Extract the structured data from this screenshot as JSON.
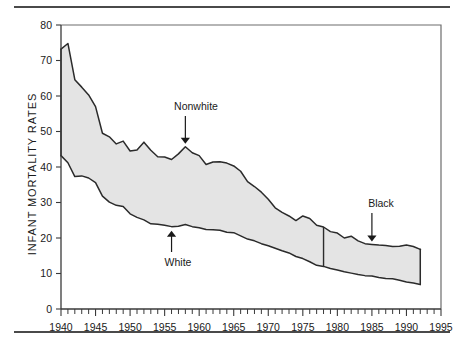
{
  "figure": {
    "top_rule": "",
    "bottom_rule": ""
  },
  "chart_data": {
    "type": "area",
    "title": "",
    "subtitle": "",
    "xlabel": "",
    "ylabel": "INFANT MORTALITY RATES",
    "xlim": [
      1940,
      1995
    ],
    "ylim": [
      0,
      80
    ],
    "grid": false,
    "legend_position": "inline-annotations",
    "y_ticks": [
      0,
      10,
      20,
      30,
      40,
      50,
      60,
      70,
      80
    ],
    "y_tick_labels": [
      "0",
      "10",
      "20",
      "30",
      "40",
      "50",
      "60",
      "70",
      "80"
    ],
    "x_ticks": [
      1940,
      1945,
      1950,
      1955,
      1960,
      1965,
      1970,
      1975,
      1980,
      1985,
      1990,
      1995
    ],
    "x_tick_labels": [
      "1940",
      "1945",
      "1950",
      "1955",
      "1960",
      "1965",
      "1970",
      "1975",
      "1980",
      "1985",
      "1990",
      "1995"
    ],
    "x_minor_tick_step": 1,
    "fill_color": "#e4e4e4",
    "line_color": "#2b2b2b",
    "x": [
      1940,
      1941,
      1942,
      1943,
      1944,
      1945,
      1946,
      1947,
      1948,
      1949,
      1950,
      1951,
      1952,
      1953,
      1954,
      1955,
      1956,
      1957,
      1958,
      1959,
      1960,
      1961,
      1962,
      1963,
      1964,
      1965,
      1966,
      1967,
      1968,
      1969,
      1970,
      1971,
      1972,
      1973,
      1974,
      1975,
      1976,
      1977,
      1978,
      1979,
      1980,
      1981,
      1982,
      1983,
      1984,
      1985,
      1986,
      1987,
      1988,
      1989,
      1990,
      1991,
      1992
    ],
    "series": [
      {
        "name": "Nonwhite / Black",
        "role": "upper-bound",
        "label_segment_1": "Nonwhite",
        "label_segment_2": "Black",
        "values": [
          73.2,
          74.8,
          64.6,
          62.5,
          60.3,
          57.0,
          49.5,
          48.5,
          46.5,
          47.3,
          44.5,
          44.8,
          47.0,
          44.7,
          42.9,
          42.8,
          42.1,
          43.7,
          45.7,
          44.0,
          43.2,
          40.7,
          41.4,
          41.5,
          41.1,
          40.3,
          38.8,
          35.9,
          34.5,
          32.9,
          30.9,
          28.5,
          27.2,
          26.2,
          24.9,
          26.2,
          25.5,
          23.6,
          23.1,
          21.8,
          21.4,
          20.0,
          20.5,
          19.2,
          18.4,
          18.2,
          18.0,
          17.9,
          17.6,
          17.7,
          18.0,
          17.6,
          16.8
        ]
      },
      {
        "name": "White",
        "role": "lower-bound",
        "label_segment_1": "White",
        "values": [
          43.2,
          41.2,
          37.3,
          37.5,
          36.9,
          35.6,
          31.8,
          30.1,
          29.2,
          28.9,
          26.8,
          25.8,
          25.1,
          24.0,
          23.9,
          23.6,
          23.2,
          23.3,
          23.8,
          23.2,
          22.9,
          22.4,
          22.3,
          22.2,
          21.6,
          21.5,
          20.6,
          19.7,
          19.2,
          18.4,
          17.8,
          17.1,
          16.4,
          15.8,
          14.8,
          14.2,
          13.3,
          12.3,
          12.0,
          11.4,
          11.0,
          10.5,
          10.1,
          9.7,
          9.4,
          9.3,
          8.9,
          8.6,
          8.5,
          8.1,
          7.6,
          7.3,
          6.9
        ]
      }
    ],
    "annotations": [
      {
        "id": "nonwhite",
        "label": "Nonwhite",
        "arrow": "down",
        "points_at_year": 1958,
        "points_at_value": 45.7
      },
      {
        "id": "white",
        "label": "White",
        "arrow": "up",
        "points_at_year": 1956,
        "points_at_value": 23.2
      },
      {
        "id": "black",
        "label": "Black",
        "arrow": "down",
        "points_at_year": 1985,
        "points_at_value": 18.2
      }
    ],
    "markers": [
      {
        "id": "category-change-divider",
        "type": "vertical-line",
        "year": 1978,
        "note": "separates Nonwhite series from Black series"
      }
    ]
  }
}
